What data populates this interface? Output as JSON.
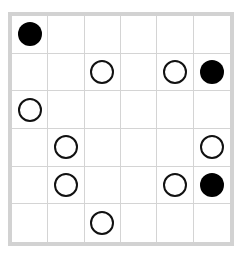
{
  "board": {
    "rows": 6,
    "cols": 6,
    "colors": {
      "black": "#000000",
      "white": "#ffffff",
      "grid": "#d4d4d4",
      "frame": "#d2d2d2"
    },
    "cells": [
      [
        "black",
        "",
        "",
        "",
        "",
        ""
      ],
      [
        "",
        "",
        "white",
        "",
        "white",
        "black"
      ],
      [
        "white",
        "",
        "",
        "",
        "",
        ""
      ],
      [
        "",
        "white",
        "",
        "",
        "",
        "white"
      ],
      [
        "",
        "white",
        "",
        "",
        "white",
        "black"
      ],
      [
        "",
        "",
        "white",
        "",
        "",
        ""
      ]
    ]
  }
}
